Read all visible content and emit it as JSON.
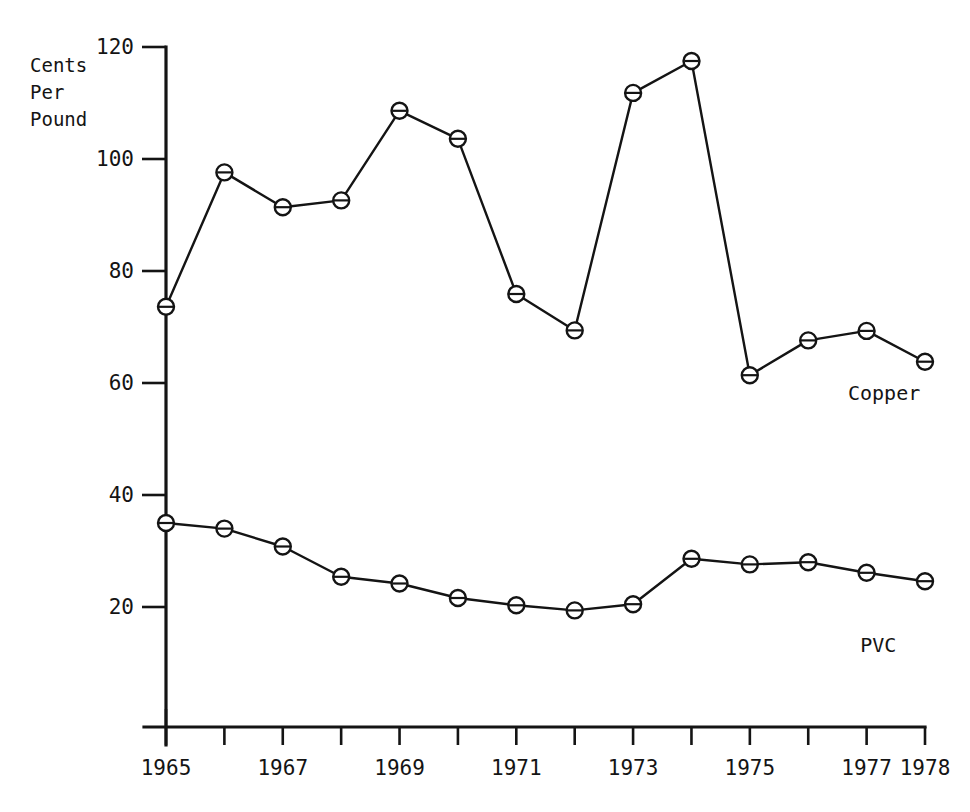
{
  "chart_data": {
    "type": "line",
    "title": "",
    "subtitle": "",
    "xlabel": "",
    "ylabel": "Cents Per Pound",
    "ylabel_lines": [
      "Cents",
      "Per",
      "Pound"
    ],
    "x": [
      1965,
      1966,
      1967,
      1968,
      1969,
      1970,
      1971,
      1972,
      1973,
      1974,
      1975,
      1976,
      1977,
      1978
    ],
    "x_tick_labels": [
      "1965",
      "",
      "1967",
      "",
      "1969",
      "",
      "1971",
      "",
      "1973",
      "",
      "1975",
      "",
      "1977",
      "1978"
    ],
    "xlim": [
      1965,
      1978
    ],
    "ylim": [
      0,
      120
    ],
    "y_ticks": [
      20,
      40,
      60,
      80,
      100,
      120
    ],
    "y_tick_labels": [
      "20",
      "40",
      "60",
      "80",
      "100",
      "120"
    ],
    "grid": false,
    "legend_position": "inline-right",
    "series": [
      {
        "name": "Copper",
        "label": "Copper",
        "label_x": 1977.3,
        "label_y": 57.0,
        "values": [
          73.6,
          97.6,
          91.4,
          92.6,
          108.6,
          103.6,
          75.9,
          69.4,
          111.8,
          117.5,
          61.4,
          67.6,
          69.3,
          63.8
        ]
      },
      {
        "name": "PVC",
        "label": "PVC",
        "label_x": 1977.2,
        "label_y": 12.0,
        "values": [
          35.0,
          34.0,
          30.8,
          25.4,
          24.2,
          21.6,
          20.3,
          19.4,
          20.5,
          28.6,
          27.6,
          28.0,
          26.1,
          24.6
        ]
      }
    ],
    "marker_style": "circle-with-horizontal-bar",
    "line_color": "#141414",
    "background_color": "#ffffff"
  },
  "axes": {
    "y_axis_name": "y-axis",
    "x_axis_name": "x-axis"
  }
}
